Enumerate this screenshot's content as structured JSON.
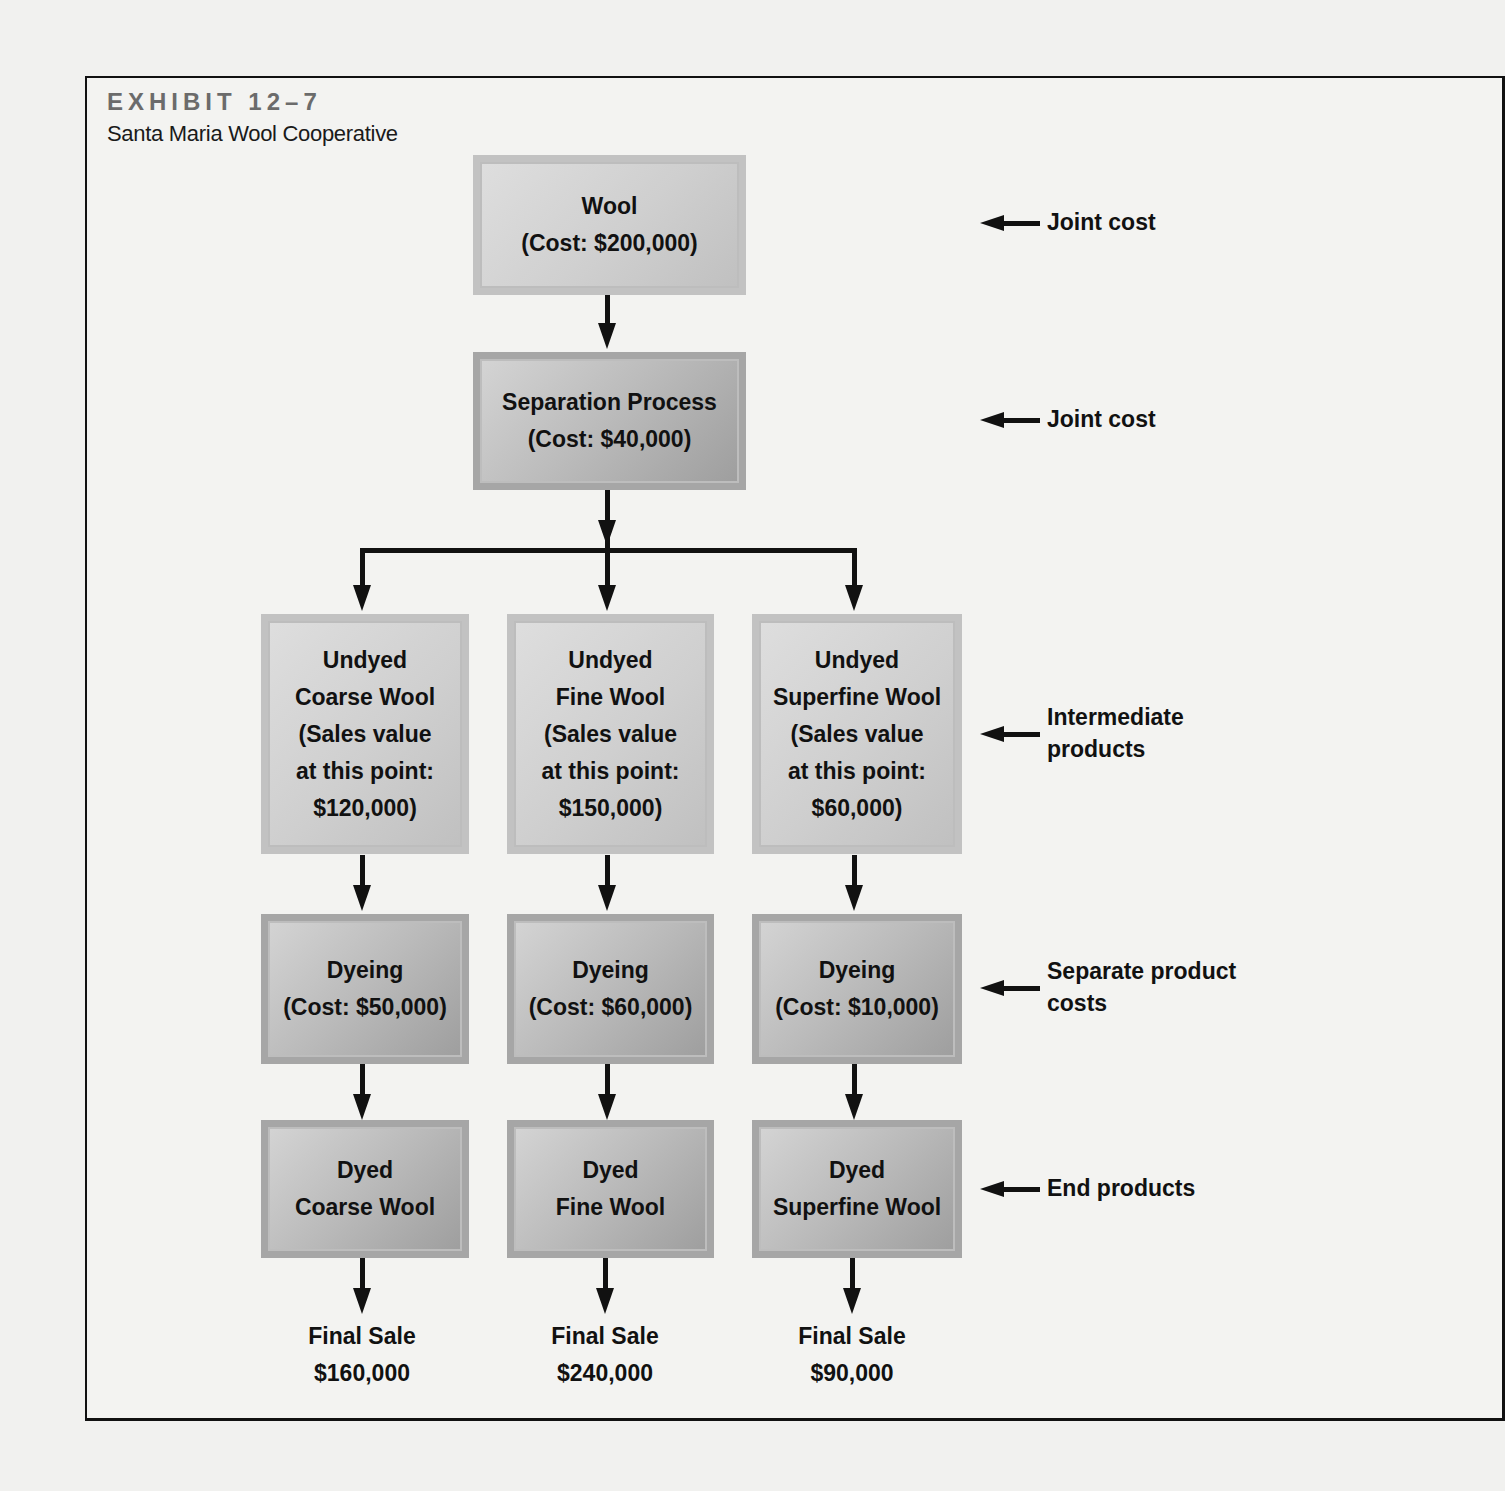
{
  "exhibit": {
    "label": "EXHIBIT 12–7",
    "title": "Santa Maria Wool Cooperative"
  },
  "nodes": {
    "wool": {
      "line1": "Wool",
      "line2": "(Cost: $200,000)"
    },
    "separation": {
      "line1": "Separation Process",
      "line2": "(Cost: $40,000)"
    },
    "intermediate": [
      {
        "line1": "Undyed",
        "line2": "Coarse Wool",
        "line3": "(Sales value",
        "line4": "at this point:",
        "line5": "$120,000)"
      },
      {
        "line1": "Undyed",
        "line2": "Fine Wool",
        "line3": "(Sales value",
        "line4": "at this point:",
        "line5": "$150,000)"
      },
      {
        "line1": "Undyed",
        "line2": "Superfine Wool",
        "line3": "(Sales value",
        "line4": "at this point:",
        "line5": "$60,000)"
      }
    ],
    "dyeing": [
      {
        "line1": "Dyeing",
        "line2": "(Cost: $50,000)"
      },
      {
        "line1": "Dyeing",
        "line2": "(Cost: $60,000)"
      },
      {
        "line1": "Dyeing",
        "line2": "(Cost: $10,000)"
      }
    ],
    "end": [
      {
        "line1": "Dyed",
        "line2": "Coarse Wool"
      },
      {
        "line1": "Dyed",
        "line2": "Fine Wool"
      },
      {
        "line1": "Dyed",
        "line2": "Superfine Wool"
      }
    ],
    "final_sale": [
      {
        "line1": "Final Sale",
        "line2": "$160,000"
      },
      {
        "line1": "Final Sale",
        "line2": "$240,000"
      },
      {
        "line1": "Final Sale",
        "line2": "$90,000"
      }
    ]
  },
  "annotations": {
    "joint_cost_1": "Joint cost",
    "joint_cost_2": "Joint cost",
    "intermediate_line1": "Intermediate",
    "intermediate_line2": "products",
    "separate_line1": "Separate product",
    "separate_line2": "costs",
    "end_products": "End products"
  }
}
